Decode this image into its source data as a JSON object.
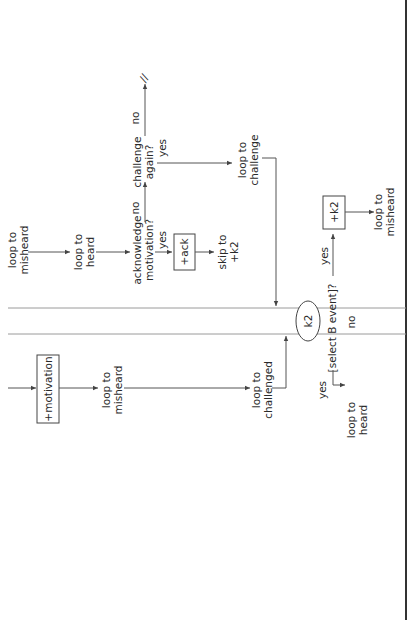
{
  "diagram": {
    "orientation": "rotated-90-ccw",
    "nodes": {
      "loop_misheard_top": [
        "loop to",
        "misheard"
      ],
      "loop_heard_top": [
        "loop to",
        "heard"
      ],
      "acknowledge": [
        "acknowledge",
        "motivation?"
      ],
      "challenge_again": [
        "challenge",
        "again?"
      ],
      "end_mark": "//",
      "ack_box": "+ack",
      "skip_k2": [
        "skip to",
        "+k2"
      ],
      "loop_challenge": [
        "loop to",
        "challenge"
      ],
      "k2_box": "+k2",
      "loop_misheard_right": [
        "loop to",
        "misheard"
      ],
      "motivation_box": "+motivation",
      "loop_misheard_mid": [
        "loop to",
        "misheard"
      ],
      "loop_challenged": [
        "loop to",
        "challenged"
      ],
      "k2_circle": "k2",
      "select_b": "[select B event]?",
      "loop_heard_bottom": [
        "loop to",
        "heard"
      ]
    },
    "edge_labels": {
      "ack_no": "no",
      "ack_yes": "yes",
      "challenge_no": "no",
      "challenge_yes": "yes",
      "select_yes_top": "yes",
      "select_no": "no",
      "select_yes_bottom": "yes"
    }
  }
}
